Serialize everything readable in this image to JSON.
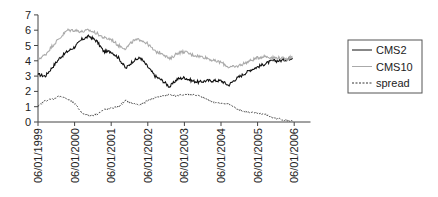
{
  "chart_data": {
    "type": "line",
    "title": "",
    "xlabel": "",
    "ylabel": "",
    "ylim": [
      0,
      7
    ],
    "yticks": [
      "0",
      "1",
      "2",
      "3",
      "4",
      "5",
      "6",
      "7"
    ],
    "xlim": [
      0,
      7.5
    ],
    "xticks": [
      "06/01/1999",
      "06/01/2000",
      "06/01/2001",
      "06/01/2002",
      "06/01/2003",
      "06/01/2004",
      "06/01/2005",
      "06/01/2006"
    ],
    "grid": false,
    "legend_position": "right",
    "x": [
      0,
      0.2,
      0.4,
      0.6,
      0.8,
      1.0,
      1.2,
      1.4,
      1.6,
      1.8,
      2.0,
      2.2,
      2.4,
      2.6,
      2.8,
      3.0,
      3.2,
      3.4,
      3.6,
      3.8,
      4.0,
      4.2,
      4.4,
      4.6,
      4.8,
      5.0,
      5.2,
      5.4,
      5.6,
      5.8,
      6.0,
      6.2,
      6.4,
      6.6,
      6.8,
      6.95
    ],
    "x_unit": "years since 06/01/1999",
    "series": [
      {
        "name": "CMS2",
        "style": "solid",
        "color": "#111111",
        "values": [
          3.1,
          3.0,
          3.6,
          4.2,
          4.6,
          4.9,
          5.4,
          5.6,
          5.3,
          4.6,
          4.6,
          4.2,
          3.5,
          4.0,
          4.2,
          3.6,
          3.0,
          2.7,
          2.3,
          2.8,
          2.9,
          2.7,
          2.6,
          2.7,
          2.7,
          2.7,
          2.4,
          2.8,
          3.1,
          3.4,
          3.6,
          3.8,
          4.0,
          4.0,
          4.1,
          4.2
        ]
      },
      {
        "name": "CMS10",
        "style": "solid",
        "color": "#aaaaaa",
        "values": [
          4.1,
          4.4,
          5.0,
          5.5,
          6.0,
          6.0,
          5.9,
          6.0,
          5.8,
          5.5,
          5.4,
          5.0,
          4.8,
          5.3,
          5.4,
          5.1,
          4.6,
          4.5,
          4.1,
          4.5,
          4.6,
          4.4,
          4.3,
          4.2,
          4.0,
          3.9,
          3.6,
          3.6,
          3.8,
          4.0,
          4.2,
          4.3,
          4.2,
          4.2,
          4.1,
          4.3
        ]
      },
      {
        "name": "spread",
        "style": "dashed",
        "color": "#333333",
        "values": [
          1.0,
          1.4,
          1.5,
          1.7,
          1.5,
          1.2,
          0.6,
          0.4,
          0.5,
          0.8,
          0.9,
          1.0,
          1.4,
          1.2,
          1.1,
          1.4,
          1.6,
          1.7,
          1.8,
          1.7,
          1.8,
          1.8,
          1.7,
          1.5,
          1.3,
          1.2,
          1.2,
          0.9,
          0.7,
          0.6,
          0.6,
          0.5,
          0.3,
          0.2,
          0.1,
          0.05
        ]
      }
    ]
  }
}
